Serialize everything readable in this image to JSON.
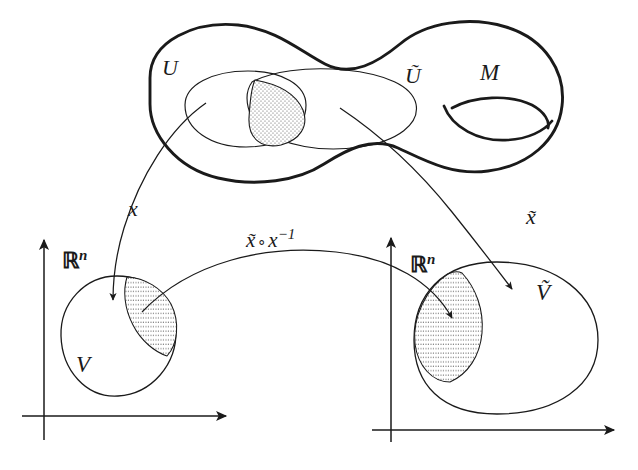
{
  "figure": {
    "domain": "differential-geometry",
    "background_color": "#ffffff",
    "ink_color": "#1a1a1a",
    "hatch_color": "#555555"
  },
  "manifold": {
    "label": "M",
    "description": "genus-one surface outline drawn with a thick stroke",
    "open_sets": [
      {
        "key": "U",
        "label": "U"
      },
      {
        "key": "Utilde",
        "label": "Ũ"
      }
    ],
    "overlap": {
      "label": "",
      "description": "lens-shaped dotted intersection of U and Ũ"
    }
  },
  "charts": {
    "left": {
      "axis_label": "ℝ",
      "axis_exponent": "n",
      "region_label": "V",
      "map_label": "x",
      "hatched_region_note": "image of U ∩ Ũ under x"
    },
    "right": {
      "axis_label": "ℝ",
      "axis_exponent": "n",
      "region_label": "Ṽ",
      "map_label": "x̃",
      "hatched_region_note": "image of U ∩ Ũ under x̃"
    }
  },
  "transition": {
    "label_head": "x̃",
    "label_circ": "∘",
    "label_tail": "x",
    "label_exponent": "−1",
    "full_label": "x̃ ∘ x⁻¹"
  }
}
